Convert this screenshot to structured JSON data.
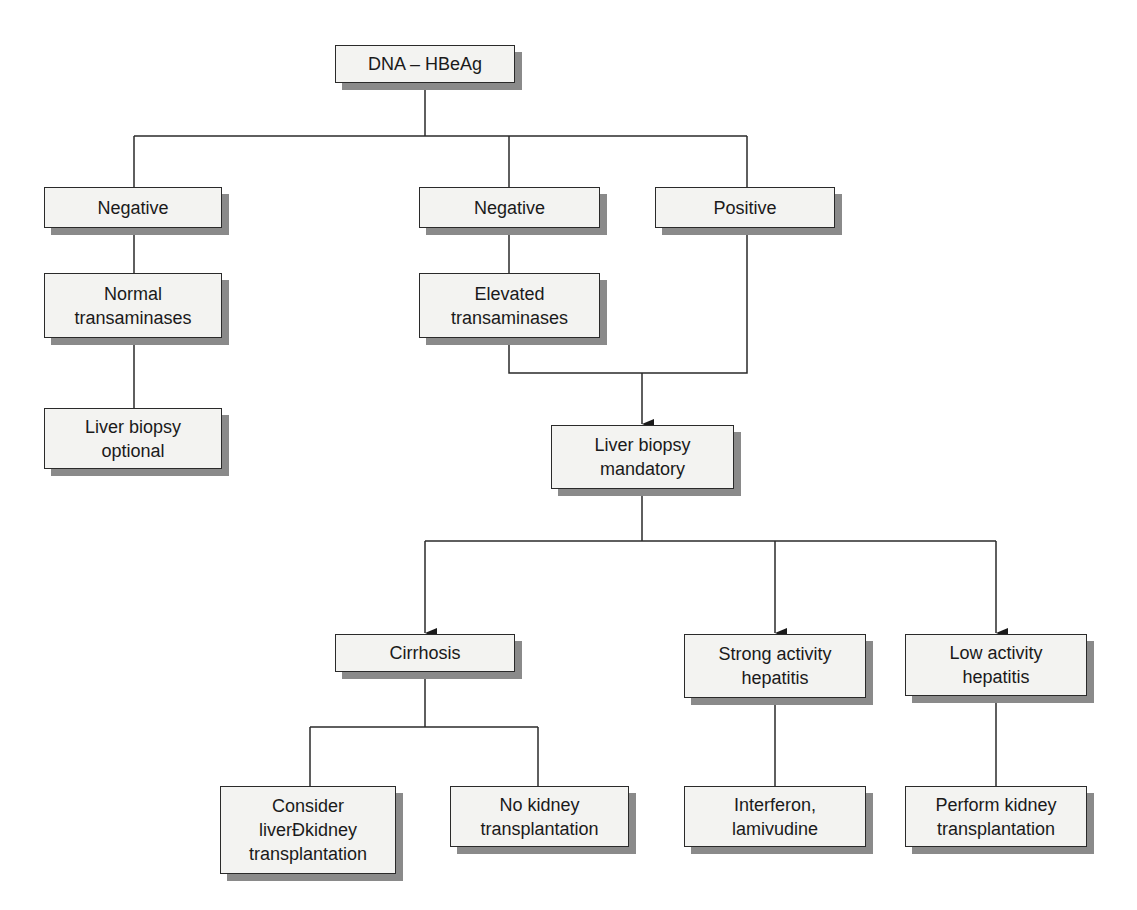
{
  "diagram": {
    "type": "flowchart",
    "nodes": {
      "root": "DNA – HBeAg",
      "neg_left": "Negative",
      "neg_mid": "Negative",
      "pos": "Positive",
      "normal_trans": "Normal\ntransaminases",
      "elevated_trans": "Elevated\ntransaminases",
      "biopsy_optional": "Liver biopsy\noptional",
      "biopsy_mandatory": "Liver biopsy\nmandatory",
      "cirrhosis": "Cirrhosis",
      "strong_activity": "Strong activity\nhepatitis",
      "low_activity": "Low activity\nhepatitis",
      "consider_liver_kidney": "Consider\nliverÐkidney\ntransplantation",
      "no_kidney": "No kidney\ntransplantation",
      "interferon": "Interferon,\nlamivudine",
      "perform_kidney": "Perform kidney\ntransplantation"
    },
    "edges": [
      [
        "root",
        "neg_left"
      ],
      [
        "root",
        "neg_mid"
      ],
      [
        "root",
        "pos"
      ],
      [
        "neg_left",
        "normal_trans"
      ],
      [
        "normal_trans",
        "biopsy_optional"
      ],
      [
        "neg_mid",
        "elevated_trans"
      ],
      [
        "elevated_trans",
        "biopsy_mandatory"
      ],
      [
        "pos",
        "biopsy_mandatory"
      ],
      [
        "biopsy_mandatory",
        "cirrhosis"
      ],
      [
        "biopsy_mandatory",
        "strong_activity"
      ],
      [
        "biopsy_mandatory",
        "low_activity"
      ],
      [
        "cirrhosis",
        "consider_liver_kidney"
      ],
      [
        "cirrhosis",
        "no_kidney"
      ],
      [
        "strong_activity",
        "interferon"
      ],
      [
        "low_activity",
        "perform_kidney"
      ]
    ]
  }
}
